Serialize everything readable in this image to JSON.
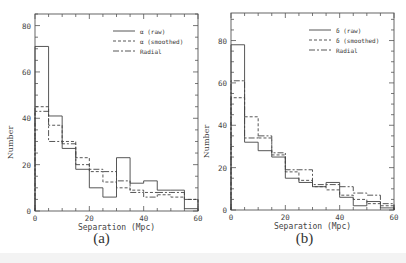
{
  "figure": {
    "panels": [
      {
        "id": "a",
        "caption": "(a)"
      },
      {
        "id": "b",
        "caption": "(b)"
      }
    ]
  },
  "chart_data": [
    {
      "type": "bar",
      "subtype": "step-histogram",
      "panel": "(a)",
      "title": "",
      "xlabel": "Separation (Mpc)",
      "ylabel": "Number",
      "xlim": [
        0,
        60
      ],
      "ylim": [
        0,
        85
      ],
      "xticks": [
        0,
        20,
        40,
        60
      ],
      "yticks": [
        0,
        20,
        40,
        60,
        80
      ],
      "bin_edges": [
        0,
        5,
        10,
        15,
        20,
        25,
        30,
        35,
        40,
        45,
        50,
        55,
        60
      ],
      "grid": false,
      "legend_position": "upper right",
      "series": [
        {
          "name": "α (raw)",
          "style": "solid",
          "values": [
            71,
            41,
            27,
            18,
            10,
            6,
            23,
            12,
            13,
            9,
            9,
            1
          ]
        },
        {
          "name": "α (smoothed)",
          "style": "dashed",
          "values": [
            45,
            37,
            30,
            23,
            17,
            12.5,
            10,
            9,
            8,
            7,
            6,
            5
          ]
        },
        {
          "name": "Radial",
          "style": "dash-dot",
          "values": [
            43,
            30,
            29,
            20,
            18,
            17,
            13,
            8,
            6,
            8,
            8,
            5
          ]
        }
      ]
    },
    {
      "type": "bar",
      "subtype": "step-histogram",
      "panel": "(b)",
      "title": "",
      "xlabel": "Separation (Mpc)",
      "ylabel": "Number",
      "xlim": [
        0,
        60
      ],
      "ylim": [
        0,
        93
      ],
      "xticks": [
        0,
        20,
        40,
        60
      ],
      "yticks": [
        0,
        20,
        40,
        60,
        80
      ],
      "bin_edges": [
        0,
        5,
        10,
        15,
        20,
        25,
        30,
        35,
        40,
        45,
        50,
        55,
        60
      ],
      "grid": false,
      "legend_position": "upper right",
      "series": [
        {
          "name": "δ (raw)",
          "style": "solid",
          "values": [
            78,
            32,
            28,
            25,
            15,
            13,
            11,
            13,
            6,
            2,
            4,
            1
          ]
        },
        {
          "name": "δ (smoothed)",
          "style": "dashed",
          "values": [
            53,
            44,
            34,
            26,
            18,
            14,
            11,
            9.5,
            7,
            5,
            3,
            2
          ]
        },
        {
          "name": "Radial",
          "style": "dash-dot",
          "values": [
            61,
            34,
            35,
            27,
            19,
            19,
            12,
            12,
            11,
            8,
            7,
            3
          ]
        }
      ]
    }
  ]
}
